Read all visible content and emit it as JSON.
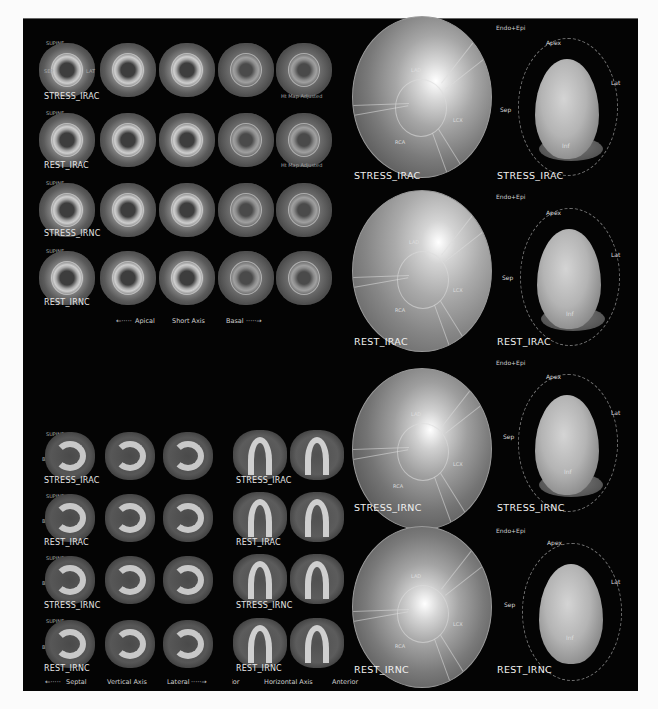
{
  "short_axis": {
    "orientation_label": "SUPINE",
    "side_labels": {
      "left": "SEP",
      "right": "LAT",
      "bottom": "INF"
    },
    "rows": [
      {
        "label": "STRESS_IRAC",
        "note": "Ht Map Adjusted"
      },
      {
        "label": "REST_IRAC",
        "note": "Ht Map Adjusted"
      },
      {
        "label": "STRESS_IRNC",
        "note": ""
      },
      {
        "label": "REST_IRNC",
        "note": ""
      }
    ],
    "axis_legend": {
      "left": "Apical",
      "center": "Short Axis",
      "right": "Basal"
    }
  },
  "vertical_long_axis": {
    "orientation_label": "SUPINE",
    "side_label": "BASE",
    "rows": [
      "STRESS_IRAC",
      "REST_IRAC",
      "STRESS_IRNC",
      "REST_IRNC"
    ],
    "axis_legend": {
      "left": "Septal",
      "center": "Vertical Axis",
      "right": "Lateral"
    }
  },
  "horizontal_long_axis": {
    "orientation_label": "SUPINE",
    "rows": [
      "STRESS_IRAC",
      "REST_IRAC",
      "STRESS_IRNC",
      "REST_IRNC"
    ],
    "axis_legend": {
      "left": "Inferior",
      "center": "Horizontal Axis",
      "right": "Anterior"
    }
  },
  "polar_maps": [
    {
      "label": "STRESS_IRAC",
      "territories": {
        "lad": "LAD",
        "lcx": "LCX",
        "rca": "RCA"
      }
    },
    {
      "label": "REST_IRAC",
      "territories": {
        "lad": "LAD",
        "lcx": "LCX",
        "rca": "RCA"
      }
    },
    {
      "label": "STRESS_IRNC",
      "territories": {
        "lad": "LAD",
        "lcx": "LCX",
        "rca": "RCA"
      }
    },
    {
      "label": "REST_IRNC",
      "territories": {
        "lad": "LAD",
        "lcx": "LCX",
        "rca": "RCA"
      }
    }
  ],
  "lv_3d": [
    {
      "label": "STRESS_IRAC",
      "mode": "Endo+Epi",
      "apex": "Apex",
      "lat": "Lat",
      "sep": "Sep",
      "inf": "Inf"
    },
    {
      "label": "REST_IRAC",
      "mode": "Endo+Epi",
      "apex": "Apex",
      "lat": "Lat",
      "sep": "Sep",
      "inf": "Inf"
    },
    {
      "label": "STRESS_IRNC",
      "mode": "Endo+Epi",
      "apex": "Apex",
      "lat": "Lat",
      "sep": "Sep",
      "inf": "Inf"
    },
    {
      "label": "REST_IRNC",
      "mode": "Endo+Epi",
      "apex": "Apex",
      "lat": "Lat",
      "sep": "Sep",
      "inf": "Inf"
    }
  ],
  "colors": {
    "background": "#040404",
    "page": "#fbfbfb",
    "text": "#e6e6e6"
  }
}
